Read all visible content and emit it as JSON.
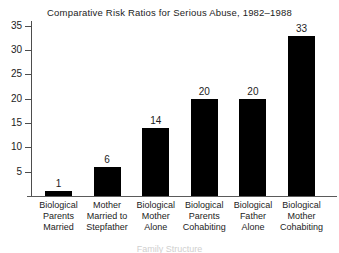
{
  "chart_data": {
    "type": "bar",
    "title": "Comparative Risk Ratios for Serious Abuse, 1982–1988",
    "xlabel": "Family Structure",
    "ylabel": "",
    "categories": [
      "Biological Parents Married",
      "Mother Married to Stepfather",
      "Biological Mother Alone",
      "Biological Parents Cohabiting",
      "Biological Father Alone",
      "Biological Mother Cohabiting"
    ],
    "category_lines": [
      [
        "Biological",
        "Parents",
        "Married"
      ],
      [
        "Mother",
        "Married to",
        "Stepfather"
      ],
      [
        "Biological",
        "Mother",
        "Alone"
      ],
      [
        "Biological",
        "Parents",
        "Cohabiting"
      ],
      [
        "Biological",
        "Father",
        "Alone"
      ],
      [
        "Biological",
        "Mother",
        "Cohabiting"
      ]
    ],
    "values": [
      1,
      6,
      14,
      20,
      20,
      33
    ],
    "value_labels": [
      "1",
      "6",
      "14",
      "20",
      "20",
      "33"
    ],
    "ylim": [
      0,
      36
    ],
    "yticks": [
      5,
      10,
      15,
      20,
      25,
      30,
      35
    ],
    "ytick_labels": [
      "5",
      "10",
      "15",
      "20",
      "25",
      "30",
      "35"
    ],
    "grid": false,
    "legend": false,
    "bar_color": "#000000",
    "axis_color": "#4d4d4d",
    "background": "#ffffff"
  }
}
